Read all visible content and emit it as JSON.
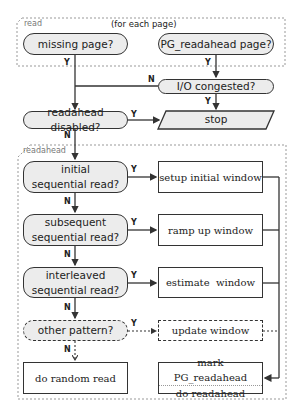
{
  "groups": {
    "read": {
      "label": "read",
      "note": "(for each page)"
    },
    "readahead": {
      "label": "readahead"
    }
  },
  "nodes": {
    "missing_page": "missing page?",
    "pg_readahead_page": "PG_readahead page?",
    "io_congested": "I/O congested?",
    "readahead_disabled": "readahead disabled?",
    "stop": "stop",
    "initial_seq": [
      "initial",
      "sequential read?"
    ],
    "subsequent_seq": [
      "subsequent",
      "sequential read?"
    ],
    "interleaved_seq": [
      "interleaved",
      "sequential read?"
    ],
    "other_pattern": "other pattern?",
    "setup_initial_window": "setup initial window",
    "ramp_up_window": "ramp up window",
    "estimate_window": "estimate  window",
    "update_window": "update window",
    "do_random_read": "do random read",
    "mark_readahead": [
      "mark PG_readahead",
      "do readahead"
    ]
  },
  "edge_labels": {
    "yes": "Y",
    "no": "N"
  },
  "colors": {
    "decision_fill": "#ececec",
    "stroke": "#333333",
    "group_border": "#999999"
  }
}
